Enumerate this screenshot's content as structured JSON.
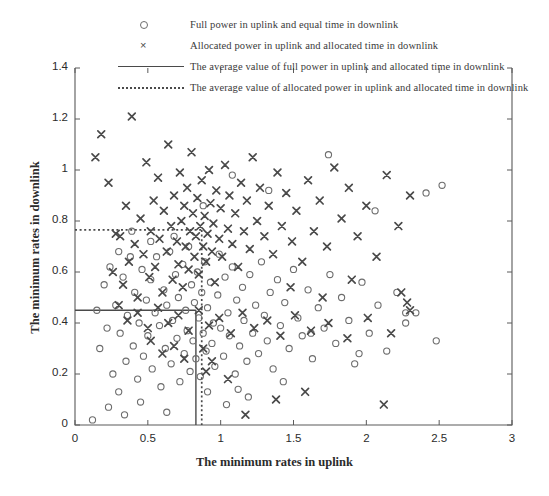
{
  "chart_data": {
    "type": "scatter",
    "title": "",
    "xlabel": "The minimum rates in uplink",
    "ylabel": "The minimum rates in downlink",
    "xlim": [
      0,
      3
    ],
    "ylim": [
      0,
      1.4
    ],
    "xticks": [
      "0",
      "0.5",
      "1",
      "1.5",
      "2",
      "2.5",
      "3"
    ],
    "xtick_values": [
      0,
      0.5,
      1,
      1.5,
      2,
      2.5,
      3
    ],
    "yticks": [
      "0",
      "0.2",
      "0.4",
      "0.6",
      "0.8",
      "1",
      "1.2",
      "1.4"
    ],
    "ytick_values": [
      0,
      0.2,
      0.4,
      0.6,
      0.8,
      1.0,
      1.2,
      1.4
    ],
    "grid": false,
    "legend_position": "above-axes",
    "series": [
      {
        "name": "Full power in uplink and equal time in downlink",
        "marker": "circle",
        "color": "#6d6d6d",
        "points": [
          [
            0.12,
            0.02
          ],
          [
            0.15,
            0.45
          ],
          [
            0.17,
            0.3
          ],
          [
            0.2,
            0.55
          ],
          [
            0.22,
            0.38
          ],
          [
            0.24,
            0.62
          ],
          [
            0.26,
            0.2
          ],
          [
            0.28,
            0.47
          ],
          [
            0.3,
            0.13
          ],
          [
            0.31,
            0.36
          ],
          [
            0.33,
            0.58
          ],
          [
            0.35,
            0.25
          ],
          [
            0.36,
            0.43
          ],
          [
            0.38,
            0.66
          ],
          [
            0.4,
            0.31
          ],
          [
            0.41,
            0.52
          ],
          [
            0.43,
            0.18
          ],
          [
            0.44,
            0.4
          ],
          [
            0.46,
            0.61
          ],
          [
            0.47,
            0.27
          ],
          [
            0.49,
            0.49
          ],
          [
            0.5,
            0.35
          ],
          [
            0.52,
            0.57
          ],
          [
            0.53,
            0.22
          ],
          [
            0.55,
            0.44
          ],
          [
            0.56,
            0.66
          ],
          [
            0.58,
            0.39
          ],
          [
            0.59,
            0.15
          ],
          [
            0.61,
            0.53
          ],
          [
            0.62,
            0.3
          ],
          [
            0.63,
            0.47
          ],
          [
            0.65,
            0.68
          ],
          [
            0.66,
            0.24
          ],
          [
            0.67,
            0.41
          ],
          [
            0.69,
            0.59
          ],
          [
            0.7,
            0.34
          ],
          [
            0.71,
            0.5
          ],
          [
            0.72,
            0.17
          ],
          [
            0.74,
            0.63
          ],
          [
            0.75,
            0.28
          ],
          [
            0.76,
            0.45
          ],
          [
            0.77,
            0.37
          ],
          [
            0.78,
            0.7
          ],
          [
            0.79,
            0.21
          ],
          [
            0.8,
            0.55
          ],
          [
            0.81,
            0.33
          ],
          [
            0.82,
            0.48
          ],
          [
            0.83,
            0.26
          ],
          [
            0.84,
            0.6
          ],
          [
            0.85,
            0.42
          ],
          [
            0.86,
            0.19
          ],
          [
            0.87,
            0.52
          ],
          [
            0.88,
            0.36
          ],
          [
            0.89,
            0.64
          ],
          [
            0.9,
            0.29
          ],
          [
            0.91,
            0.46
          ],
          [
            0.93,
            0.56
          ],
          [
            0.94,
            0.32
          ],
          [
            0.95,
            0.4
          ],
          [
            0.96,
            0.23
          ],
          [
            0.98,
            0.51
          ],
          [
            0.99,
            0.67
          ],
          [
            1.0,
            0.38
          ],
          [
            1.02,
            0.27
          ],
          [
            1.03,
            0.58
          ],
          [
            1.05,
            0.44
          ],
          [
            1.06,
            0.35
          ],
          [
            1.08,
            0.62
          ],
          [
            1.1,
            0.2
          ],
          [
            1.11,
            0.49
          ],
          [
            1.13,
            0.31
          ],
          [
            1.15,
            0.54
          ],
          [
            1.16,
            0.41
          ],
          [
            1.18,
            0.25
          ],
          [
            1.2,
            0.59
          ],
          [
            1.22,
            0.36
          ],
          [
            1.24,
            0.47
          ],
          [
            1.26,
            0.28
          ],
          [
            1.28,
            0.64
          ],
          [
            1.3,
            0.43
          ],
          [
            1.32,
            0.33
          ],
          [
            1.34,
            0.52
          ],
          [
            1.36,
            0.22
          ],
          [
            1.39,
            0.57
          ],
          [
            1.41,
            0.39
          ],
          [
            1.44,
            0.48
          ],
          [
            1.47,
            0.3
          ],
          [
            1.5,
            0.61
          ],
          [
            1.53,
            0.42
          ],
          [
            1.56,
            0.35
          ],
          [
            1.6,
            0.53
          ],
          [
            1.63,
            0.26
          ],
          [
            1.67,
            0.46
          ],
          [
            1.71,
            0.38
          ],
          [
            1.75,
            0.59
          ],
          [
            1.79,
            0.32
          ],
          [
            1.83,
            0.5
          ],
          [
            1.88,
            0.41
          ],
          [
            1.92,
            0.24
          ],
          [
            1.97,
            0.56
          ],
          [
            2.02,
            0.36
          ],
          [
            2.08,
            0.47
          ],
          [
            2.14,
            0.29
          ],
          [
            2.21,
            0.52
          ],
          [
            2.27,
            0.4
          ],
          [
            2.34,
            0.44
          ],
          [
            2.41,
            0.91
          ],
          [
            2.52,
            0.94
          ],
          [
            2.06,
            0.84
          ],
          [
            1.74,
            1.06
          ],
          [
            1.33,
            0.92
          ],
          [
            1.08,
            0.98
          ],
          [
            0.88,
            0.86
          ],
          [
            0.68,
            0.74
          ],
          [
            0.52,
            0.72
          ],
          [
            0.39,
            0.76
          ],
          [
            0.3,
            0.68
          ],
          [
            0.23,
            0.07
          ],
          [
            0.34,
            0.04
          ],
          [
            0.63,
            0.05
          ],
          [
            0.45,
            0.09
          ],
          [
            1.04,
            0.08
          ],
          [
            1.19,
            0.11
          ],
          [
            0.91,
            0.13
          ],
          [
            2.27,
            0.44
          ],
          [
            1.62,
            0.36
          ],
          [
            2.48,
            0.33
          ],
          [
            1.95,
            0.28
          ],
          [
            1.43,
            0.17
          ],
          [
            1.12,
            0.14
          ]
        ]
      },
      {
        "name": "Allocated power in uplink and allocated time in downlink",
        "marker": "cross",
        "color": "#4a4a4a",
        "points": [
          [
            0.14,
            1.05
          ],
          [
            0.18,
            1.14
          ],
          [
            0.23,
            0.95
          ],
          [
            0.26,
            0.6
          ],
          [
            0.28,
            0.75
          ],
          [
            0.31,
            0.74
          ],
          [
            0.33,
            0.55
          ],
          [
            0.35,
            0.86
          ],
          [
            0.37,
            0.64
          ],
          [
            0.39,
            1.21
          ],
          [
            0.41,
            0.71
          ],
          [
            0.43,
            0.5
          ],
          [
            0.45,
            0.81
          ],
          [
            0.47,
            0.67
          ],
          [
            0.49,
            1.03
          ],
          [
            0.51,
            0.58
          ],
          [
            0.52,
            0.76
          ],
          [
            0.54,
            0.88
          ],
          [
            0.55,
            0.62
          ],
          [
            0.57,
            0.97
          ],
          [
            0.58,
            0.73
          ],
          [
            0.6,
            0.52
          ],
          [
            0.61,
            0.84
          ],
          [
            0.63,
            0.68
          ],
          [
            0.64,
            1.1
          ],
          [
            0.66,
            0.78
          ],
          [
            0.67,
            0.57
          ],
          [
            0.68,
            0.9
          ],
          [
            0.7,
            0.72
          ],
          [
            0.71,
            0.63
          ],
          [
            0.72,
            0.99
          ],
          [
            0.73,
            0.8
          ],
          [
            0.74,
            0.54
          ],
          [
            0.75,
            0.86
          ],
          [
            0.76,
            0.7
          ],
          [
            0.77,
            0.93
          ],
          [
            0.78,
            0.61
          ],
          [
            0.79,
            0.76
          ],
          [
            0.8,
            1.07
          ],
          [
            0.81,
            0.83
          ],
          [
            0.82,
            0.66
          ],
          [
            0.83,
            0.74
          ],
          [
            0.84,
            0.89
          ],
          [
            0.85,
            0.59
          ],
          [
            0.86,
            0.78
          ],
          [
            0.87,
            0.96
          ],
          [
            0.88,
            0.7
          ],
          [
            0.89,
            0.82
          ],
          [
            0.9,
            0.64
          ],
          [
            0.91,
            0.75
          ],
          [
            0.92,
            1.0
          ],
          [
            0.93,
            0.87
          ],
          [
            0.94,
            0.68
          ],
          [
            0.95,
            0.79
          ],
          [
            0.96,
            0.56
          ],
          [
            0.97,
            0.92
          ],
          [
            0.99,
            0.73
          ],
          [
            1.0,
            0.85
          ],
          [
            1.01,
            0.66
          ],
          [
            1.03,
            1.02
          ],
          [
            1.05,
            0.77
          ],
          [
            1.06,
            0.9
          ],
          [
            1.08,
            0.71
          ],
          [
            1.1,
            0.83
          ],
          [
            1.12,
            0.62
          ],
          [
            1.14,
            0.95
          ],
          [
            1.16,
            0.76
          ],
          [
            1.18,
            0.88
          ],
          [
            1.2,
            0.69
          ],
          [
            1.22,
            1.05
          ],
          [
            1.25,
            0.8
          ],
          [
            1.27,
            0.93
          ],
          [
            1.3,
            0.74
          ],
          [
            1.33,
            0.86
          ],
          [
            1.36,
            0.67
          ],
          [
            1.39,
            0.99
          ],
          [
            1.42,
            0.78
          ],
          [
            1.45,
            0.91
          ],
          [
            1.49,
            0.72
          ],
          [
            1.52,
            0.84
          ],
          [
            1.56,
            0.64
          ],
          [
            1.6,
            0.96
          ],
          [
            1.64,
            0.76
          ],
          [
            1.68,
            0.88
          ],
          [
            1.73,
            0.7
          ],
          [
            1.78,
            1.01
          ],
          [
            1.83,
            0.81
          ],
          [
            1.88,
            0.93
          ],
          [
            1.94,
            0.74
          ],
          [
            2.0,
            0.86
          ],
          [
            2.07,
            0.66
          ],
          [
            2.14,
            0.98
          ],
          [
            2.22,
            0.78
          ],
          [
            2.3,
            0.9
          ],
          [
            0.3,
            0.47
          ],
          [
            0.36,
            0.41
          ],
          [
            0.43,
            0.44
          ],
          [
            0.5,
            0.38
          ],
          [
            0.57,
            0.46
          ],
          [
            0.64,
            0.4
          ],
          [
            0.71,
            0.43
          ],
          [
            0.78,
            0.37
          ],
          [
            0.85,
            0.45
          ],
          [
            0.92,
            0.39
          ],
          [
            0.99,
            0.42
          ],
          [
            1.07,
            0.36
          ],
          [
            1.15,
            0.44
          ],
          [
            1.23,
            0.38
          ],
          [
            1.32,
            0.41
          ],
          [
            1.41,
            0.35
          ],
          [
            1.51,
            0.43
          ],
          [
            1.62,
            0.37
          ],
          [
            1.74,
            0.4
          ],
          [
            1.87,
            0.34
          ],
          [
            2.01,
            0.42
          ],
          [
            2.17,
            0.36
          ],
          [
            2.3,
            0.45
          ],
          [
            0.88,
            0.3
          ],
          [
            0.9,
            0.21
          ],
          [
            0.94,
            0.25
          ],
          [
            1.05,
            0.18
          ],
          [
            1.17,
            0.04
          ],
          [
            1.38,
            0.1
          ],
          [
            1.58,
            0.13
          ],
          [
            2.12,
            0.08
          ],
          [
            2.28,
            0.48
          ],
          [
            0.52,
            0.33
          ],
          [
            0.6,
            0.28
          ],
          [
            0.68,
            0.31
          ],
          [
            0.75,
            0.26
          ],
          [
            1.48,
            0.54
          ],
          [
            1.7,
            0.5
          ],
          [
            1.9,
            0.57
          ],
          [
            2.24,
            0.52
          ]
        ]
      }
    ],
    "reference_lines": [
      {
        "name": "The average value of full power in uplink and allocated time in downlink",
        "style": "solid",
        "color": "#4a4a4a",
        "x": 0.83,
        "y": 0.45
      },
      {
        "name": "The average value of allocated power in uplink and allocated time in downlink",
        "style": "dotted",
        "color": "#4a4a4a",
        "x": 0.87,
        "y": 0.765
      }
    ]
  },
  "legend": {
    "items": [
      {
        "key": "circle-marker",
        "label": "Full power in uplink and equal time in downlink"
      },
      {
        "key": "cross-marker",
        "label": "Allocated power in uplink and allocated time in downlink"
      },
      {
        "key": "solid-line",
        "label": "The average value of full power in uplink and allocated time in downlink"
      },
      {
        "key": "dotted-line",
        "label": "The average value of allocated power in uplink and allocated time in downlink"
      }
    ]
  },
  "axes": {
    "x_title": "The minimum rates in uplink",
    "y_title": "The minimum rates in downlink"
  }
}
